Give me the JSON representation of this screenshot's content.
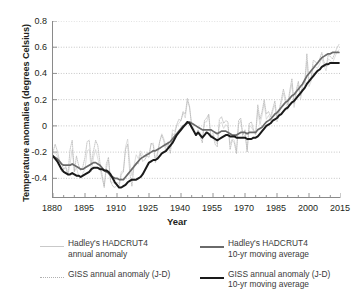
{
  "chart_data": {
    "type": "line",
    "title": "",
    "xlabel": "Year",
    "ylabel": "Temperature anomalies (degrees Celsius)",
    "xlim": [
      1880,
      2015
    ],
    "ylim": [
      -0.55,
      0.8
    ],
    "xticks": [
      1880,
      1895,
      1910,
      1925,
      1940,
      1955,
      1970,
      1985,
      2000,
      2015
    ],
    "xminor_step": 5,
    "yticks": [
      -0.4,
      -0.2,
      0,
      0.2,
      0.4,
      0.6,
      0.8
    ],
    "grid": "horizontal dotted",
    "legend_position": "below",
    "series": [
      {
        "name": "Hadley's HADCRUT4 annual anomaly",
        "style": "thin-solid",
        "color": "#c9c9c9",
        "x_start": 1880,
        "values": [
          -0.22,
          -0.2,
          -0.23,
          -0.27,
          -0.35,
          -0.33,
          -0.32,
          -0.38,
          -0.29,
          -0.18,
          -0.35,
          -0.32,
          -0.38,
          -0.4,
          -0.36,
          -0.33,
          -0.19,
          -0.18,
          -0.35,
          -0.24,
          -0.18,
          -0.25,
          -0.32,
          -0.4,
          -0.46,
          -0.33,
          -0.26,
          -0.43,
          -0.43,
          -0.44,
          -0.43,
          -0.44,
          -0.35,
          -0.34,
          -0.16,
          -0.1,
          -0.28,
          -0.38,
          -0.3,
          -0.22,
          -0.25,
          -0.19,
          -0.22,
          -0.24,
          -0.2,
          -0.21,
          -0.14,
          -0.13,
          -0.25,
          -0.2,
          -0.12,
          -0.06,
          -0.1,
          -0.16,
          -0.12,
          -0.17,
          -0.03,
          -0.04,
          0.0,
          0.02,
          0.04,
          0.1,
          0.06,
          0.19,
          0.14,
          0.01,
          -0.02,
          -0.06,
          -0.04,
          -0.05,
          -0.1,
          0.03,
          0.03,
          0.08,
          -0.08,
          -0.05,
          -0.11,
          -0.14,
          0.01,
          0.03,
          -0.02,
          0.01,
          -0.01,
          -0.14,
          -0.1,
          -0.11,
          -0.19,
          0.01,
          0.04,
          -0.09,
          -0.07,
          -0.18,
          0.0,
          -0.01,
          -0.04,
          -0.07,
          0.12,
          0.01,
          0.08,
          0.17,
          0.05,
          0.08,
          0.04,
          0.11,
          0.16,
          0.03,
          0.08,
          0.17,
          0.25,
          0.18,
          0.12,
          0.24,
          0.32,
          0.14,
          0.24,
          0.31,
          0.2,
          0.28,
          0.3,
          0.49,
          0.3,
          0.34,
          0.46,
          0.45,
          0.44,
          0.47,
          0.52,
          0.46,
          0.42,
          0.51,
          0.5,
          0.48,
          0.52,
          0.56,
          0.58
        ]
      },
      {
        "name": "Hadley's HADCRUT4 10-yr moving average",
        "style": "thick-solid",
        "color": "#6a6a6a",
        "x_start": 1880,
        "values": [
          -0.23,
          -0.24,
          -0.25,
          -0.27,
          -0.29,
          -0.3,
          -0.3,
          -0.3,
          -0.3,
          -0.29,
          -0.3,
          -0.31,
          -0.32,
          -0.33,
          -0.33,
          -0.32,
          -0.31,
          -0.3,
          -0.29,
          -0.28,
          -0.28,
          -0.29,
          -0.3,
          -0.32,
          -0.34,
          -0.35,
          -0.36,
          -0.38,
          -0.39,
          -0.4,
          -0.4,
          -0.41,
          -0.41,
          -0.41,
          -0.39,
          -0.37,
          -0.35,
          -0.33,
          -0.31,
          -0.29,
          -0.27,
          -0.25,
          -0.24,
          -0.23,
          -0.22,
          -0.21,
          -0.2,
          -0.19,
          -0.19,
          -0.18,
          -0.17,
          -0.16,
          -0.15,
          -0.14,
          -0.13,
          -0.12,
          -0.1,
          -0.08,
          -0.06,
          -0.04,
          -0.02,
          0.0,
          0.01,
          0.02,
          0.03,
          0.02,
          0.01,
          0.0,
          -0.01,
          -0.02,
          -0.03,
          -0.03,
          -0.03,
          -0.03,
          -0.03,
          -0.04,
          -0.05,
          -0.06,
          -0.05,
          -0.04,
          -0.04,
          -0.04,
          -0.05,
          -0.06,
          -0.07,
          -0.07,
          -0.07,
          -0.06,
          -0.05,
          -0.05,
          -0.05,
          -0.06,
          -0.05,
          -0.05,
          -0.05,
          -0.05,
          -0.03,
          -0.02,
          -0.01,
          0.01,
          0.03,
          0.04,
          0.05,
          0.07,
          0.09,
          0.1,
          0.12,
          0.14,
          0.16,
          0.18,
          0.19,
          0.21,
          0.23,
          0.24,
          0.26,
          0.28,
          0.3,
          0.32,
          0.35,
          0.38,
          0.4,
          0.42,
          0.44,
          0.46,
          0.48,
          0.5,
          0.52,
          0.53,
          0.54,
          0.55,
          0.55,
          0.56,
          0.56,
          0.56,
          0.56
        ]
      },
      {
        "name": "GISS annual anomaly (J-D)",
        "style": "dotted",
        "color": "#b0b0b0",
        "x_start": 1880,
        "values": [
          -0.2,
          -0.14,
          -0.19,
          -0.26,
          -0.29,
          -0.33,
          -0.31,
          -0.37,
          -0.18,
          -0.11,
          -0.35,
          -0.23,
          -0.3,
          -0.34,
          -0.31,
          -0.24,
          -0.12,
          -0.11,
          -0.29,
          -0.19,
          -0.11,
          -0.15,
          -0.28,
          -0.37,
          -0.47,
          -0.29,
          -0.24,
          -0.42,
          -0.46,
          -0.47,
          -0.45,
          -0.46,
          -0.37,
          -0.35,
          -0.18,
          -0.14,
          -0.36,
          -0.46,
          -0.3,
          -0.28,
          -0.29,
          -0.21,
          -0.27,
          -0.26,
          -0.23,
          -0.24,
          -0.13,
          -0.15,
          -0.28,
          -0.22,
          -0.12,
          -0.07,
          -0.12,
          -0.2,
          -0.14,
          -0.21,
          -0.06,
          -0.07,
          0.01,
          0.05,
          0.04,
          0.11,
          0.09,
          0.21,
          0.15,
          0.0,
          -0.04,
          -0.07,
          -0.03,
          -0.08,
          -0.13,
          0.04,
          0.06,
          0.09,
          -0.09,
          -0.07,
          -0.14,
          -0.16,
          0.05,
          0.07,
          0.02,
          0.04,
          0.03,
          -0.18,
          -0.11,
          -0.13,
          -0.21,
          0.04,
          0.06,
          -0.07,
          -0.03,
          -0.2,
          0.02,
          0.03,
          -0.03,
          -0.06,
          0.16,
          0.05,
          0.11,
          0.2,
          0.09,
          0.11,
          0.07,
          0.13,
          0.19,
          0.06,
          0.12,
          0.2,
          0.28,
          0.21,
          0.16,
          0.27,
          0.36,
          0.17,
          0.27,
          0.34,
          0.23,
          0.31,
          0.33,
          0.55,
          0.34,
          0.37,
          0.5,
          0.49,
          0.47,
          0.51,
          0.56,
          0.49,
          0.45,
          0.54,
          0.53,
          0.51,
          0.55,
          0.59,
          0.62
        ]
      },
      {
        "name": "GISS annual anomaly (J-D) 10-yr moving average",
        "style": "thick-solid",
        "color": "#1a1a1a",
        "x_start": 1880,
        "values": [
          -0.23,
          -0.25,
          -0.27,
          -0.3,
          -0.33,
          -0.35,
          -0.36,
          -0.37,
          -0.37,
          -0.36,
          -0.37,
          -0.38,
          -0.38,
          -0.39,
          -0.38,
          -0.37,
          -0.36,
          -0.35,
          -0.33,
          -0.32,
          -0.32,
          -0.32,
          -0.33,
          -0.33,
          -0.34,
          -0.34,
          -0.35,
          -0.37,
          -0.4,
          -0.43,
          -0.45,
          -0.47,
          -0.47,
          -0.46,
          -0.45,
          -0.43,
          -0.42,
          -0.41,
          -0.41,
          -0.41,
          -0.4,
          -0.39,
          -0.37,
          -0.34,
          -0.31,
          -0.28,
          -0.27,
          -0.26,
          -0.26,
          -0.25,
          -0.23,
          -0.21,
          -0.2,
          -0.19,
          -0.17,
          -0.15,
          -0.13,
          -0.1,
          -0.07,
          -0.05,
          -0.03,
          -0.01,
          0.01,
          0.03,
          0.02,
          -0.01,
          -0.04,
          -0.07,
          -0.05,
          -0.07,
          -0.09,
          -0.07,
          -0.05,
          -0.06,
          -0.08,
          -0.09,
          -0.1,
          -0.11,
          -0.1,
          -0.09,
          -0.08,
          -0.07,
          -0.07,
          -0.08,
          -0.08,
          -0.08,
          -0.09,
          -0.09,
          -0.09,
          -0.09,
          -0.09,
          -0.1,
          -0.1,
          -0.1,
          -0.09,
          -0.09,
          -0.08,
          -0.06,
          -0.04,
          -0.02,
          0.0,
          0.01,
          0.02,
          0.04,
          0.05,
          0.06,
          0.08,
          0.09,
          0.11,
          0.13,
          0.14,
          0.16,
          0.18,
          0.19,
          0.21,
          0.23,
          0.25,
          0.27,
          0.29,
          0.32,
          0.34,
          0.36,
          0.38,
          0.4,
          0.42,
          0.43,
          0.45,
          0.46,
          0.47,
          0.47,
          0.48,
          0.48,
          0.48,
          0.48,
          0.48
        ]
      }
    ]
  },
  "legend": {
    "entries": [
      {
        "label_line1": "Hadley's HADCRUT4",
        "label_line2": "annual anomaly",
        "swatch": "thin-gray-line-icon"
      },
      {
        "label_line1": "Hadley's HADCRUT4",
        "label_line2": "10-yr moving average",
        "swatch": "thick-gray-line-icon"
      },
      {
        "label_line1": "GISS annual anomaly (J-D)",
        "label_line2": "",
        "swatch": "dotted-gray-line-icon"
      },
      {
        "label_line1": "GISS annual anomaly (J-D)",
        "label_line2": "10-yr moving average",
        "swatch": "thick-black-line-icon"
      }
    ]
  },
  "axis": {
    "y_title": "Temperature anomalies (degrees Celsius)",
    "x_title": "Year",
    "y_labels": [
      "0.8",
      "0.6",
      "0.4",
      "0.2",
      "0",
      "-0.2",
      "-0.4"
    ],
    "x_labels": [
      "1880",
      "1895",
      "1910",
      "1925",
      "1940",
      "1955",
      "1970",
      "1985",
      "2000",
      "2015"
    ]
  },
  "colors": {
    "axis": "#8a8a8a",
    "grid": "#bfbfbf",
    "text": "#231f20",
    "hadley_annual": "#c9c9c9",
    "hadley_avg": "#6a6a6a",
    "giss_annual": "#b0b0b0",
    "giss_avg": "#1a1a1a"
  }
}
